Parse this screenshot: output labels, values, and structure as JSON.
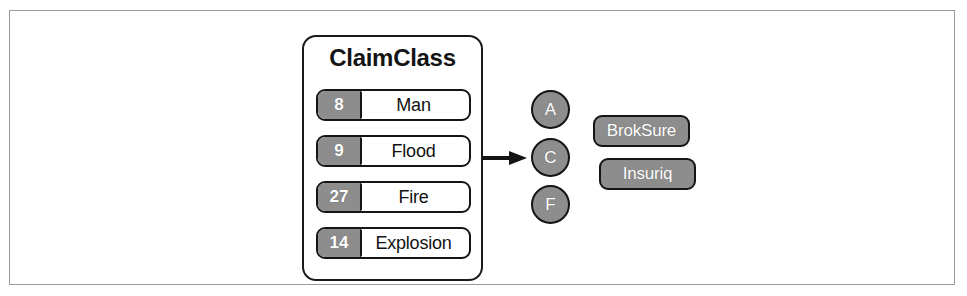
{
  "diagram": {
    "title": "ClaimClass",
    "claim_classes": [
      {
        "count": "8",
        "label": "Man"
      },
      {
        "count": "9",
        "label": "Flood"
      },
      {
        "count": "27",
        "label": "Fire"
      },
      {
        "count": "14",
        "label": "Explosion"
      }
    ],
    "codes": [
      {
        "label": "A"
      },
      {
        "label": "C"
      },
      {
        "label": "F"
      }
    ],
    "systems": [
      {
        "label": "BrokSure"
      },
      {
        "label": "Insuriq"
      }
    ],
    "arrow": {
      "name": "flow-arrow",
      "direction": "right"
    },
    "colors": {
      "fill_gray": "#8d8d8d",
      "stroke_dark": "#141414",
      "frame_gray": "#9a9a9a",
      "background": "#ffffff",
      "text_light": "#ffffff",
      "text_dark": "#121212"
    }
  }
}
